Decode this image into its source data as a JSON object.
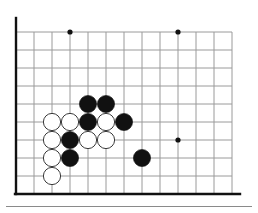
{
  "diagram": {
    "board_type": "go-board-partial",
    "geometry": {
      "origin_x": 16,
      "origin_y": 32,
      "cell_size": 18,
      "columns": 13,
      "rows": 10,
      "stone_radius": 8.6
    },
    "colors": {
      "background": "#ffffff",
      "grid_line": "#9a9a9a",
      "border_line": "#111111",
      "black_stone": "#111111",
      "white_stone_fill": "#ffffff",
      "white_stone_edge": "#3a3a3a",
      "star_point": "#111111",
      "rule": "#8a8a8a"
    },
    "borders": {
      "left_edge": true,
      "bottom_edge": true,
      "top_edge": false,
      "right_edge": false
    },
    "star_points": [
      {
        "col": 3,
        "row": 0
      },
      {
        "col": 9,
        "row": 0
      },
      {
        "col": 9,
        "row": 6
      }
    ],
    "stones": [
      {
        "color": "black",
        "col": 4,
        "row": 4
      },
      {
        "color": "black",
        "col": 5,
        "row": 4
      },
      {
        "color": "white",
        "col": 2,
        "row": 5
      },
      {
        "color": "white",
        "col": 3,
        "row": 5
      },
      {
        "color": "black",
        "col": 4,
        "row": 5
      },
      {
        "color": "white",
        "col": 5,
        "row": 5
      },
      {
        "color": "black",
        "col": 6,
        "row": 5
      },
      {
        "color": "white",
        "col": 2,
        "row": 6
      },
      {
        "color": "black",
        "col": 3,
        "row": 6
      },
      {
        "color": "white",
        "col": 4,
        "row": 6
      },
      {
        "color": "white",
        "col": 5,
        "row": 6
      },
      {
        "color": "white",
        "col": 2,
        "row": 7
      },
      {
        "color": "black",
        "col": 3,
        "row": 7
      },
      {
        "color": "black",
        "col": 7,
        "row": 7
      },
      {
        "color": "white",
        "col": 2,
        "row": 8
      }
    ],
    "counts": {
      "black_stones": 7,
      "white_stones": 8,
      "total_stones": 15
    }
  }
}
